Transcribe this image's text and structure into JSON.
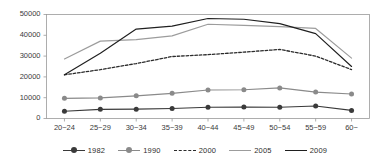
{
  "chart_data": {
    "type": "line",
    "title": "",
    "subtitle": "",
    "xlabel": "",
    "ylabel": "",
    "categories": [
      "20~24",
      "25~29",
      "30~34",
      "35~39",
      "40~44",
      "45~49",
      "50~54",
      "55~59",
      "60~"
    ],
    "ylim": [
      0,
      50000
    ],
    "ytick_labels": [
      "0",
      "10000",
      "20000",
      "30000",
      "40000",
      "50000"
    ],
    "ytick_values": [
      0,
      10000,
      20000,
      30000,
      40000,
      50000
    ],
    "grid": false,
    "legend_position": "bottom",
    "series": [
      {
        "name": "1982",
        "color": "#3a3a3a",
        "style": "solid-marker",
        "marker": "circle",
        "values": [
          3500,
          4400,
          4500,
          4800,
          5400,
          5500,
          5400,
          6000,
          3900
        ]
      },
      {
        "name": "1990",
        "color": "#8a8a8a",
        "style": "solid-marker",
        "marker": "circle",
        "values": [
          9700,
          9900,
          10900,
          12100,
          13700,
          13800,
          14700,
          12700,
          11800
        ]
      },
      {
        "name": "2000",
        "color": "#2b2b2b",
        "style": "dashed",
        "marker": "none",
        "values": [
          21000,
          23500,
          26400,
          29800,
          30700,
          31900,
          33200,
          30000,
          23500
        ]
      },
      {
        "name": "2005",
        "color": "#9c9c9c",
        "style": "solid",
        "marker": "none",
        "values": [
          28600,
          37200,
          37900,
          39700,
          45300,
          44800,
          44200,
          43300,
          29000
        ]
      },
      {
        "name": "2009",
        "color": "#1f1f1f",
        "style": "solid",
        "marker": "none",
        "values": [
          21000,
          31400,
          43000,
          44400,
          48100,
          47700,
          45600,
          40800,
          25000
        ]
      }
    ]
  },
  "legend": {
    "items": [
      {
        "label": "1982"
      },
      {
        "label": "1990"
      },
      {
        "label": "2000"
      },
      {
        "label": "2005"
      },
      {
        "label": "2009"
      }
    ]
  }
}
